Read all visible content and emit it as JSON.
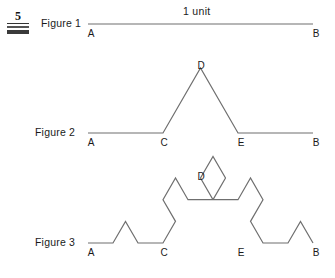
{
  "marker": {
    "number": "5",
    "icon": "problem-number-marker"
  },
  "annotations": {
    "length_label": "1 unit"
  },
  "figures": [
    {
      "caption": "Figure 1",
      "iteration": 0,
      "labels": {
        "A": "A",
        "B": "B"
      },
      "vertices_named": [
        "A",
        "B"
      ]
    },
    {
      "caption": "Figure 2",
      "iteration": 1,
      "labels": {
        "A": "A",
        "C": "C",
        "D": "D",
        "E": "E",
        "B": "B"
      },
      "vertices_named": [
        "A",
        "C",
        "D",
        "E",
        "B"
      ]
    },
    {
      "caption": "Figure 3",
      "iteration": 2,
      "labels": {
        "A": "A",
        "C": "C",
        "D": "D",
        "E": "E",
        "B": "B"
      },
      "vertices_named": [
        "A",
        "C",
        "D",
        "E",
        "B"
      ]
    }
  ],
  "geometry": {
    "stroke_color": "#6f6f6f",
    "stroke_width": 1.2,
    "x_start": 88,
    "x_end": 313,
    "figure1": {
      "baseline_y": 24,
      "points": "88,24 313,24"
    },
    "figure2": {
      "baseline_y": 133,
      "apex_y": 76,
      "points": "88,133 163,133 200.5,68.05 238,133 313,133"
    },
    "figure3": {
      "baseline_y": 243,
      "apex_y": 186,
      "points": "88,243 113,243 125.5,221.35 138,243 163,243 175.5,221.35 163,199.7 175.5,178.05 188,199.7 213,199.7 200.5,178.05 213,156.4 225.5,178.05 213,199.7 238,199.7 250.5,178.05 263,199.7 250.5,221.35 263,243 288,243 300.5,221.35 313,243"
    }
  },
  "colors": {
    "stroke": "#6f6f6f",
    "text": "#1a1a1a",
    "marker_bar": "#3a3a3a",
    "background": "#ffffff"
  }
}
